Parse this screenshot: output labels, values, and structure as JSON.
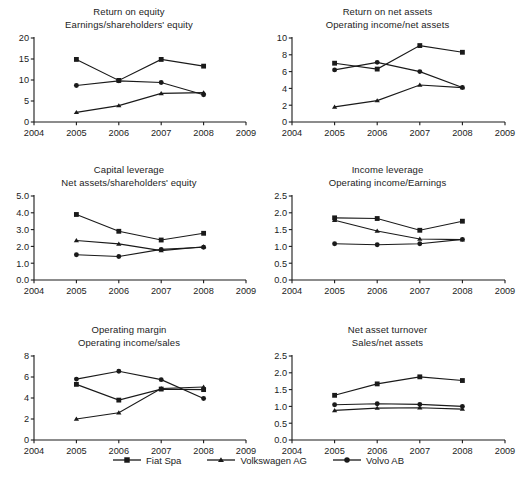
{
  "chart_data": [
    {
      "type": "line",
      "title": "Return on equity",
      "subtitle": "Earnings/shareholders' equity",
      "xlabel": "",
      "ylabel": "",
      "x": [
        2005,
        2006,
        2007,
        2008
      ],
      "xlim": [
        2004,
        2009
      ],
      "xticks": [
        2004,
        2005,
        2006,
        2007,
        2008,
        2009
      ],
      "ylim": [
        0,
        20
      ],
      "yticks": [
        0,
        5,
        10,
        15,
        20
      ],
      "ytick_labels": [
        "0",
        "5",
        "10",
        "15",
        "20"
      ],
      "grid": false,
      "series": [
        {
          "name": "Fiat Spa",
          "marker": "square",
          "values": [
            14.9,
            9.9,
            14.9,
            13.3
          ]
        },
        {
          "name": "Volkswagen AG",
          "marker": "triangle",
          "values": [
            2.3,
            3.9,
            6.8,
            7.0
          ]
        },
        {
          "name": "Volvo AB",
          "marker": "circle",
          "values": [
            8.7,
            9.8,
            9.4,
            6.5
          ]
        }
      ]
    },
    {
      "type": "line",
      "title": "Return on net assets",
      "subtitle": "Operating income/net assets",
      "xlabel": "",
      "ylabel": "",
      "x": [
        2005,
        2006,
        2007,
        2008
      ],
      "xlim": [
        2004,
        2009
      ],
      "xticks": [
        2004,
        2005,
        2006,
        2007,
        2008,
        2009
      ],
      "ylim": [
        0,
        10
      ],
      "yticks": [
        0,
        2,
        4,
        6,
        8,
        10
      ],
      "ytick_labels": [
        "0",
        "2",
        "4",
        "6",
        "8",
        "10"
      ],
      "grid": false,
      "series": [
        {
          "name": "Fiat Spa",
          "marker": "square",
          "values": [
            7.0,
            6.3,
            9.1,
            8.3
          ]
        },
        {
          "name": "Volkswagen AG",
          "marker": "triangle",
          "values": [
            1.8,
            2.55,
            4.4,
            4.1
          ]
        },
        {
          "name": "Volvo AB",
          "marker": "circle",
          "values": [
            6.2,
            7.1,
            6.0,
            4.1
          ]
        }
      ]
    },
    {
      "type": "line",
      "title": "Capital leverage",
      "subtitle": "Net assets/shareholders' equity",
      "xlabel": "",
      "ylabel": "",
      "x": [
        2005,
        2006,
        2007,
        2008
      ],
      "xlim": [
        2004,
        2009
      ],
      "xticks": [
        2004,
        2005,
        2006,
        2007,
        2008,
        2009
      ],
      "ylim": [
        0,
        5
      ],
      "yticks": [
        0,
        1,
        2,
        3,
        4,
        5
      ],
      "ytick_labels": [
        "0.0",
        "1.0",
        "2.0",
        "3.0",
        "4.0",
        "5.0"
      ],
      "grid": false,
      "series": [
        {
          "name": "Fiat Spa",
          "marker": "square",
          "values": [
            3.9,
            2.9,
            2.38,
            2.78
          ]
        },
        {
          "name": "Volkswagen AG",
          "marker": "triangle",
          "values": [
            2.35,
            2.15,
            1.75,
            1.98
          ]
        },
        {
          "name": "Volvo AB",
          "marker": "circle",
          "values": [
            1.5,
            1.4,
            1.82,
            1.95
          ]
        }
      ]
    },
    {
      "type": "line",
      "title": "Income leverage",
      "subtitle": "Operating income/Earnings",
      "xlabel": "",
      "ylabel": "",
      "x": [
        2005,
        2006,
        2007,
        2008
      ],
      "xlim": [
        2004,
        2009
      ],
      "xticks": [
        2004,
        2005,
        2006,
        2007,
        2008,
        2009
      ],
      "ylim": [
        0,
        2.5
      ],
      "yticks": [
        0,
        0.5,
        1.0,
        1.5,
        2.0,
        2.5
      ],
      "ytick_labels": [
        "0.0",
        "0.5",
        "1.0",
        "1.5",
        "2.0",
        "2.5"
      ],
      "grid": false,
      "series": [
        {
          "name": "Fiat Spa",
          "marker": "square",
          "values": [
            1.85,
            1.83,
            1.48,
            1.75
          ]
        },
        {
          "name": "Volkswagen AG",
          "marker": "triangle",
          "values": [
            1.78,
            1.46,
            1.22,
            1.2
          ]
        },
        {
          "name": "Volvo AB",
          "marker": "circle",
          "values": [
            1.08,
            1.05,
            1.08,
            1.21
          ]
        }
      ]
    },
    {
      "type": "line",
      "title": "Operating margin",
      "subtitle": "Operating income/sales",
      "xlabel": "",
      "ylabel": "",
      "x": [
        2005,
        2006,
        2007,
        2008
      ],
      "xlim": [
        2004,
        2009
      ],
      "xticks": [
        2004,
        2005,
        2006,
        2007,
        2008,
        2009
      ],
      "ylim": [
        0,
        8
      ],
      "yticks": [
        0,
        2,
        4,
        6,
        8
      ],
      "ytick_labels": [
        "0",
        "2",
        "4",
        "6",
        "8"
      ],
      "grid": false,
      "series": [
        {
          "name": "Fiat Spa",
          "marker": "square",
          "values": [
            5.3,
            3.8,
            4.85,
            4.8
          ]
        },
        {
          "name": "Volkswagen AG",
          "marker": "triangle",
          "values": [
            2.0,
            2.6,
            4.9,
            5.05
          ]
        },
        {
          "name": "Volvo AB",
          "marker": "circle",
          "values": [
            5.8,
            6.55,
            5.75,
            3.95
          ]
        }
      ]
    },
    {
      "type": "line",
      "title": "Net asset turnover",
      "subtitle": "Sales/net assets",
      "xlabel": "",
      "ylabel": "",
      "x": [
        2005,
        2006,
        2007,
        2008
      ],
      "xlim": [
        2004,
        2009
      ],
      "xticks": [
        2004,
        2005,
        2006,
        2007,
        2008,
        2009
      ],
      "ylim": [
        0,
        2.5
      ],
      "yticks": [
        0,
        0.5,
        1.0,
        1.5,
        2.0,
        2.5
      ],
      "ytick_labels": [
        "0.0",
        "0.5",
        "1.0",
        "1.5",
        "2.0",
        "2.5"
      ],
      "grid": false,
      "series": [
        {
          "name": "Fiat Spa",
          "marker": "square",
          "values": [
            1.33,
            1.67,
            1.88,
            1.77
          ]
        },
        {
          "name": "Volkswagen AG",
          "marker": "triangle",
          "values": [
            0.88,
            0.95,
            0.96,
            0.92
          ]
        },
        {
          "name": "Volvo AB",
          "marker": "circle",
          "values": [
            1.05,
            1.08,
            1.06,
            1.0
          ]
        }
      ]
    }
  ],
  "legend": {
    "position": "bottom-center",
    "items": [
      {
        "label": "Fiat Spa",
        "marker": "square"
      },
      {
        "label": "Volkswagen AG",
        "marker": "triangle"
      },
      {
        "label": "Volvo AB",
        "marker": "circle"
      }
    ]
  },
  "style": {
    "line_color": "#1a1a1a",
    "marker_color": "#1a1a1a",
    "axis_color": "#1a1a1a",
    "text_color": "#1c1c1c",
    "background": "#ffffff"
  }
}
